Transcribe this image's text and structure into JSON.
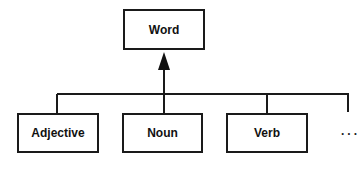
{
  "diagram": {
    "type": "class-hierarchy",
    "parent": {
      "label": "Word"
    },
    "children": [
      {
        "label": "Adjective"
      },
      {
        "label": "Noun"
      },
      {
        "label": "Verb"
      }
    ],
    "more_indicator": "...",
    "relation": "generalization (inheritance arrow pointing to parent)"
  }
}
